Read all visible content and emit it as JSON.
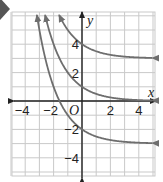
{
  "marker": {
    "shape": "diamond",
    "color": "#555555"
  },
  "chart_data": {
    "type": "line",
    "title": "",
    "xlabel": "x",
    "ylabel": "y",
    "origin_label": "O",
    "xlim": [
      -5,
      5
    ],
    "ylim": [
      -5,
      6
    ],
    "grid": true,
    "x_ticks": [
      -4,
      -2,
      2,
      4
    ],
    "y_ticks": [
      4,
      2,
      -2,
      -4
    ],
    "x_tick_labels": [
      "−4",
      "−2",
      "2",
      "4"
    ],
    "y_tick_labels": [
      "4",
      "2",
      "−2",
      "−4"
    ],
    "curve_color": "#6e6e6e",
    "series": [
      {
        "name": "upper curve",
        "formula": "y = (1/2)^x + 3",
        "asymptote": 3,
        "y_intercept": 4
      },
      {
        "name": "middle curve",
        "formula": "y = (1/2)^x",
        "asymptote": 0,
        "y_intercept": 1
      },
      {
        "name": "lower curve",
        "formula": "y = (1/2)^x - 3",
        "asymptote": -3,
        "y_intercept": -2
      }
    ]
  }
}
